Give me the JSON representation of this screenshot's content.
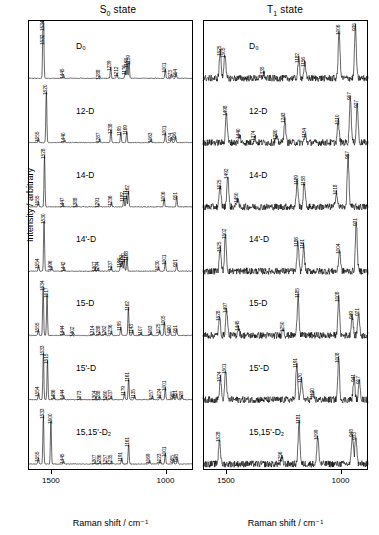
{
  "figure": {
    "ylabel": "Intensity / arbitrary",
    "xlabel": "Raman shift / cm⁻¹",
    "panels": [
      {
        "id": "s0",
        "title_main": "S",
        "title_sub": "0",
        "title_tail": " state"
      },
      {
        "id": "t1",
        "title_main": "T",
        "title_sub": "1",
        "title_tail": " state"
      }
    ],
    "xticks": [
      "1500",
      "1000"
    ],
    "xaxis_range": [
      1600,
      880
    ],
    "trace_names": [
      "D₀",
      "12-D",
      "14-D",
      "14'-D",
      "15-D",
      "15'-D",
      "15,15'-D₂"
    ]
  },
  "chart_data": {
    "type": "line",
    "xlabel": "Raman shift / cm⁻¹",
    "ylabel": "Intensity / arbitrary",
    "xlim": [
      1600,
      880
    ],
    "grid": false,
    "legend": "none",
    "panels": [
      {
        "name": "S0 state",
        "series": [
          {
            "name": "D0",
            "label": "D₀",
            "peaks": [
              1534,
              1532,
              1445,
              1288,
              1239,
              1212,
              1176,
              1168,
              1159,
              1001,
              973,
              954
            ],
            "intens": [
              1.0,
              0.72,
              0.07,
              0.05,
              0.22,
              0.1,
              0.14,
              0.28,
              0.33,
              0.18,
              0.09,
              0.11
            ]
          },
          {
            "name": "12-D",
            "label": "12-D",
            "peaks": [
              1555,
              1520,
              1440,
              1287,
              1238,
              1195,
              1169,
              1063,
              1001,
              974,
              956
            ],
            "intens": [
              0.09,
              1.0,
              0.06,
              0.07,
              0.25,
              0.2,
              0.22,
              0.07,
              0.2,
              0.11,
              0.13
            ]
          },
          {
            "name": "14-D",
            "label": "14-D",
            "peaks": [
              1555,
              1528,
              1447,
              1388,
              1291,
              1236,
              1182,
              1171,
              1162,
              1006,
              951
            ],
            "intens": [
              0.1,
              1.0,
              0.06,
              0.05,
              0.06,
              0.09,
              0.18,
              0.22,
              0.3,
              0.17,
              0.21
            ]
          },
          {
            "name": "14'-D",
            "label": "14'-D",
            "peaks": [
              1554,
              1530,
              1496,
              1442,
              1307,
              1294,
              1237,
              1189,
              1196,
              1180,
              1168,
              1030,
              1001,
              951
            ],
            "intens": [
              0.12,
              1.0,
              0.09,
              0.07,
              0.06,
              0.06,
              0.09,
              0.19,
              0.14,
              0.24,
              0.28,
              0.08,
              0.2,
              0.15
            ]
          },
          {
            "name": "15-D",
            "label": "15-D",
            "peaks": [
              1555,
              1534,
              1517,
              1444,
              1402,
              1314,
              1288,
              1262,
              1236,
              1195,
              1162,
              1143,
              1107,
              1063,
              1025,
              1005,
              980,
              951
            ],
            "intens": [
              0.12,
              0.95,
              0.8,
              0.07,
              0.05,
              0.06,
              0.07,
              0.06,
              0.08,
              0.16,
              0.55,
              0.1,
              0.06,
              0.07,
              0.1,
              0.26,
              0.12,
              0.13
            ]
          },
          {
            "name": "15'-D",
            "label": "15'-D",
            "peaks": [
              1554,
              1533,
              1515,
              1486,
              1444,
              1373,
              1304,
              1288,
              1260,
              1237,
              1179,
              1161,
              1135,
              1057,
              1024,
              1001,
              965,
              951,
              928
            ],
            "intens": [
              0.13,
              0.92,
              0.78,
              0.08,
              0.07,
              0.05,
              0.05,
              0.06,
              0.06,
              0.07,
              0.15,
              0.42,
              0.09,
              0.07,
              0.09,
              0.24,
              0.1,
              0.12,
              0.09
            ]
          },
          {
            "name": "15,15'-D2",
            "label": "15,15'-D₂",
            "peaks": [
              1555,
              1533,
              1500,
              1445,
              1307,
              1286,
              1257,
              1235,
              1191,
              1161,
              1069,
              1023,
              1001,
              965,
              948
            ],
            "intens": [
              0.12,
              0.95,
              0.85,
              0.07,
              0.05,
              0.05,
              0.05,
              0.06,
              0.12,
              0.4,
              0.07,
              0.08,
              0.22,
              0.1,
              0.12
            ]
          }
        ]
      },
      {
        "name": "T1 state",
        "series": [
          {
            "name": "D0",
            "label": "D₀",
            "peaks": [
              1525,
              1505,
              1335,
              1182,
              1156,
              1006,
              935
            ],
            "intens": [
              0.52,
              0.48,
              0.1,
              0.38,
              0.3,
              0.92,
              1.0
            ]
          },
          {
            "name": "12-D",
            "label": "12-D",
            "peaks": [
              1498,
              1440,
              1374,
              1280,
              1243,
              1154,
              1010,
              957,
              927
            ],
            "intens": [
              0.6,
              0.14,
              0.11,
              0.12,
              0.45,
              0.16,
              0.42,
              0.9,
              0.75
            ]
          },
          {
            "name": "14-D",
            "label": "14-D",
            "peaks": [
              1525,
              1492,
              1450,
              1189,
              1158,
              1018,
              967
            ],
            "intens": [
              0.4,
              0.62,
              0.16,
              0.5,
              0.48,
              0.3,
              1.0
            ]
          },
          {
            "name": "14'-D",
            "label": "14'-D",
            "peaks": [
              1525,
              1502,
              1186,
              1161,
              1004,
              931
            ],
            "intens": [
              0.45,
              0.7,
              0.55,
              0.5,
              0.42,
              0.95
            ]
          },
          {
            "name": "15-D",
            "label": "15-D",
            "peaks": [
              1528,
              1497,
              1445,
              1250,
              1185,
              1008,
              949,
              921
            ],
            "intens": [
              0.35,
              0.52,
              0.16,
              0.14,
              0.8,
              0.72,
              0.4,
              0.45
            ]
          },
          {
            "name": "15'-D",
            "label": "15'-D",
            "peaks": [
              1524,
              1501,
              1191,
              1170,
              1120,
              1008,
              941,
              917
            ],
            "intens": [
              0.42,
              0.58,
              0.7,
              0.4,
              0.12,
              0.8,
              0.42,
              0.38
            ]
          },
          {
            "name": "15,15'-D2",
            "label": "15,15'-D₂",
            "peaks": [
              1528,
              1181,
              1256,
              1099,
              948,
              933
            ],
            "intens": [
              0.5,
              0.85,
              0.12,
              0.55,
              0.6,
              0.55
            ]
          }
        ]
      }
    ]
  }
}
